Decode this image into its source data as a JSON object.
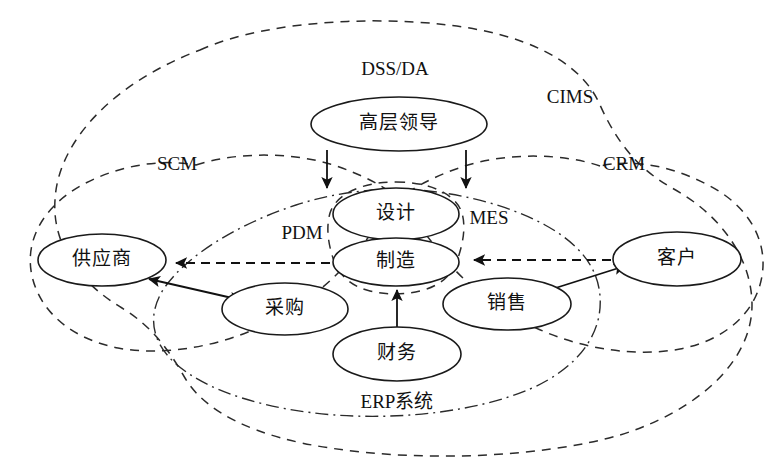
{
  "diagram": {
    "background_color": "#ffffff",
    "line_color": "#1a1a1a",
    "nodes": [
      {
        "id": "leadership",
        "label": "高层领导",
        "cx": 399,
        "cy": 124,
        "rx": 88,
        "ry": 27
      },
      {
        "id": "design",
        "label": "设计",
        "cx": 396,
        "cy": 214,
        "rx": 63,
        "ry": 26
      },
      {
        "id": "manufacture",
        "label": "制造",
        "cx": 396,
        "cy": 262,
        "rx": 63,
        "ry": 24
      },
      {
        "id": "supplier",
        "label": "供应商",
        "cx": 102,
        "cy": 260,
        "rx": 64,
        "ry": 26
      },
      {
        "id": "customer",
        "label": "客户",
        "cx": 677,
        "cy": 259,
        "rx": 64,
        "ry": 27
      },
      {
        "id": "procurement",
        "label": "采购",
        "cx": 285,
        "cy": 309,
        "rx": 63,
        "ry": 26
      },
      {
        "id": "sales",
        "label": "销售",
        "cx": 507,
        "cy": 304,
        "rx": 64,
        "ry": 26
      },
      {
        "id": "finance",
        "label": "财务",
        "cx": 397,
        "cy": 354,
        "rx": 64,
        "ry": 27
      }
    ],
    "zone_labels": [
      {
        "id": "dss-da",
        "label": "DSS/DA",
        "x": 395,
        "y": 71,
        "script": "latin"
      },
      {
        "id": "cims",
        "label": "CIMS",
        "x": 570,
        "y": 99,
        "script": "latin"
      },
      {
        "id": "scm",
        "label": "SCM",
        "x": 177,
        "y": 166,
        "script": "latin"
      },
      {
        "id": "crm",
        "label": "CRM",
        "x": 624,
        "y": 166,
        "script": "latin"
      },
      {
        "id": "pdm",
        "label": "PDM",
        "x": 302,
        "y": 235,
        "script": "latin"
      },
      {
        "id": "mes",
        "label": "MES",
        "x": 489,
        "y": 220,
        "script": "latin"
      },
      {
        "id": "erp",
        "label": "ERP系统",
        "x": 397,
        "y": 404,
        "script": "mixed"
      }
    ],
    "boundaries": [
      {
        "id": "cims-boundary",
        "label": "CIMS",
        "style": "dashed"
      },
      {
        "id": "scm-boundary",
        "label": "SCM",
        "style": "dashed"
      },
      {
        "id": "crm-boundary",
        "label": "CRM",
        "style": "dashed"
      },
      {
        "id": "erp-boundary",
        "label": "ERP系统",
        "style": "dash-dot"
      },
      {
        "id": "pdm-mes-boundary",
        "label": "PDM/MES",
        "style": "dashed"
      }
    ],
    "flows": [
      {
        "id": "leadership-to-design-left",
        "from": "高层领导",
        "to": "设计",
        "style": "solid",
        "arrow": "single"
      },
      {
        "id": "leadership-to-design-right",
        "from": "高层领导",
        "to": "设计",
        "style": "solid",
        "arrow": "single"
      },
      {
        "id": "manufacture-to-supplier",
        "from": "制造",
        "to": "供应商",
        "style": "dashed",
        "arrow": "single"
      },
      {
        "id": "customer-to-manufacture",
        "from": "客户",
        "to": "制造",
        "style": "dashed",
        "arrow": "single"
      },
      {
        "id": "supplier-to-procurement",
        "from": "供应商",
        "to": "采购",
        "style": "solid",
        "arrow": "double"
      },
      {
        "id": "sales-to-customer",
        "from": "销售",
        "to": "客户",
        "style": "solid",
        "arrow": "single"
      },
      {
        "id": "finance-to-manufacture",
        "from": "财务",
        "to": "制造",
        "style": "solid",
        "arrow": "single"
      }
    ]
  }
}
